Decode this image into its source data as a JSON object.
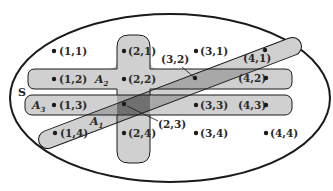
{
  "diagram": {
    "universe_label": "S",
    "sets": [
      {
        "name": "A",
        "sub": "1",
        "description": "diagonal band"
      },
      {
        "name": "A",
        "sub": "2",
        "description": "cross (row 2 + column 2)"
      },
      {
        "name": "A",
        "sub": "3",
        "description": "row 3 band"
      }
    ],
    "points": [
      {
        "label": "(1,1)"
      },
      {
        "label": "(2,1)"
      },
      {
        "label": "(3,1)"
      },
      {
        "label": "(4,1)"
      },
      {
        "label": "(1,2)"
      },
      {
        "label": "(2,2)"
      },
      {
        "label": "(3,2)"
      },
      {
        "label": "(4,2)"
      },
      {
        "label": "(1,3)"
      },
      {
        "label": "(2,3)"
      },
      {
        "label": "(3,3)"
      },
      {
        "label": "(4,3)"
      },
      {
        "label": "(1,4)"
      },
      {
        "label": "(2,4)"
      },
      {
        "label": "(3,4)"
      },
      {
        "label": "(4,4)"
      }
    ],
    "colors": {
      "region_fill": "#d0d0d0",
      "overlap_fill": "#a8a8a8",
      "triple_overlap_fill": "#707070",
      "stroke": "#1a1a1a"
    }
  }
}
